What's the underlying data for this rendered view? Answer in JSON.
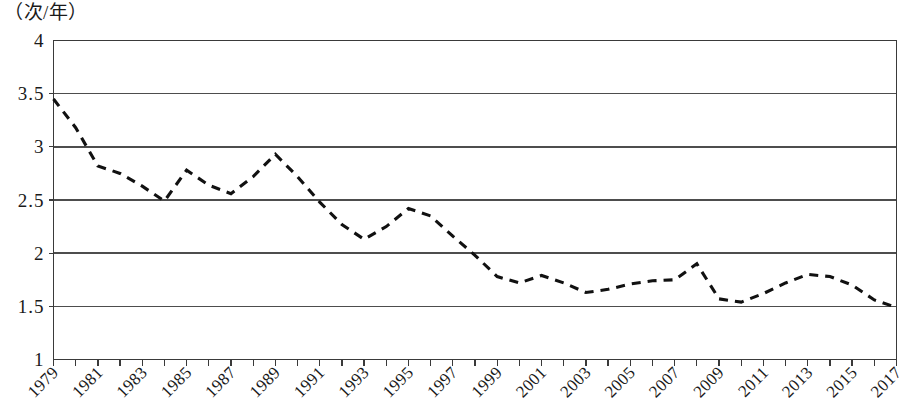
{
  "chart_data": {
    "type": "line",
    "title": "",
    "subtitle": "",
    "xlabel": "",
    "ylabel": "（次/年）",
    "ylabel_note": "times per year",
    "xlim": [
      1979,
      2017
    ],
    "ylim": [
      1,
      4
    ],
    "y_ticks": [
      "4",
      "3.5",
      "3",
      "2.5",
      "2",
      "1.5",
      "1"
    ],
    "y_tick_values": [
      4,
      3.5,
      3,
      2.5,
      2,
      1.5,
      1
    ],
    "x_ticks": [
      "1979",
      "1981",
      "1983",
      "1985",
      "1987",
      "1989",
      "1991",
      "1993",
      "1995",
      "1997",
      "1999",
      "2001",
      "2003",
      "2005",
      "2007",
      "2009",
      "2011",
      "2013",
      "2015",
      "2017"
    ],
    "x_tick_values": [
      1979,
      1981,
      1983,
      1985,
      1987,
      1989,
      1991,
      1993,
      1995,
      1997,
      1999,
      2001,
      2003,
      2005,
      2007,
      2009,
      2011,
      2013,
      2015,
      2017
    ],
    "x_tick_rotation_degrees": -45,
    "x_tick_interval_years": 2,
    "grid": "horizontal",
    "legend": "none",
    "line_style": "dashed",
    "line_color": "#111111",
    "grid_color": "#4d4d4d",
    "background_color": "#ffffff",
    "x": [
      1979,
      1980,
      1981,
      1982,
      1983,
      1984,
      1985,
      1986,
      1987,
      1988,
      1989,
      1990,
      1991,
      1992,
      1993,
      1994,
      1995,
      1996,
      1997,
      1998,
      1999,
      2000,
      2001,
      2002,
      2003,
      2004,
      2005,
      2006,
      2007,
      2008,
      2009,
      2010,
      2011,
      2012,
      2013,
      2014,
      2015,
      2016,
      2017
    ],
    "values": [
      3.45,
      3.18,
      2.82,
      2.75,
      2.63,
      2.49,
      2.78,
      2.64,
      2.56,
      2.72,
      2.93,
      2.72,
      2.48,
      2.27,
      2.13,
      2.25,
      2.42,
      2.35,
      2.16,
      1.98,
      1.78,
      1.72,
      1.79,
      1.72,
      1.63,
      1.66,
      1.71,
      1.74,
      1.75,
      1.9,
      1.57,
      1.54,
      1.62,
      1.72,
      1.8,
      1.78,
      1.7,
      1.56,
      1.49
    ],
    "series": [
      {
        "name": "",
        "values": [
          3.45,
          3.18,
          2.82,
          2.75,
          2.63,
          2.49,
          2.78,
          2.64,
          2.56,
          2.72,
          2.93,
          2.72,
          2.48,
          2.27,
          2.13,
          2.25,
          2.42,
          2.35,
          2.16,
          1.98,
          1.78,
          1.72,
          1.79,
          1.72,
          1.63,
          1.66,
          1.71,
          1.74,
          1.75,
          1.9,
          1.57,
          1.54,
          1.62,
          1.72,
          1.8,
          1.78,
          1.7,
          1.56,
          1.49
        ]
      }
    ]
  },
  "axis": {
    "unit_label": "（次/年）"
  }
}
